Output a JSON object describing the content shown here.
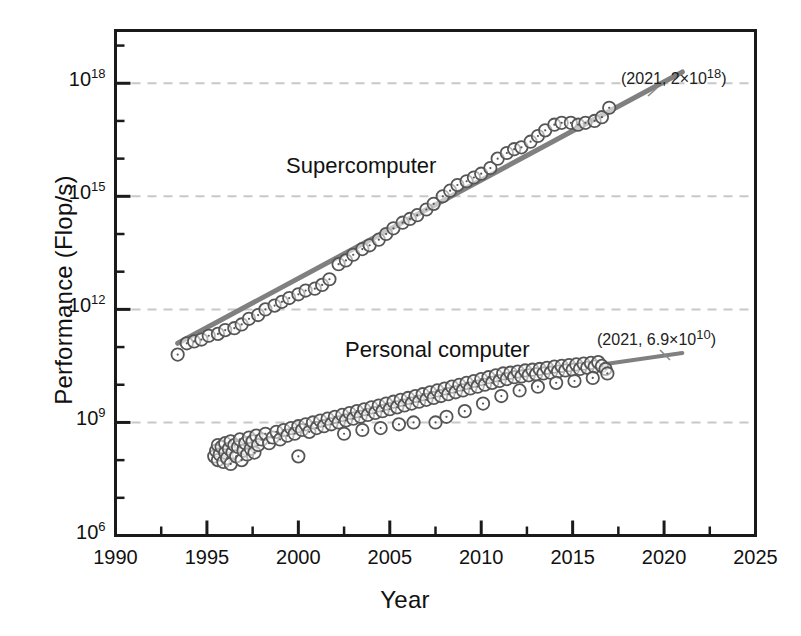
{
  "chart_data": {
    "type": "scatter",
    "title": "",
    "xlabel": "Year",
    "ylabel": "Performance (Flop/s)",
    "xlim": [
      1990,
      2025
    ],
    "ylim_exp": [
      6,
      19.4
    ],
    "y_scale": "log",
    "grid": "horizontal dashed light-gray at labeled decades",
    "legend": "inline series labels",
    "x_ticks": [
      "1990",
      "1995",
      "2000",
      "2005",
      "2010",
      "2015",
      "2020",
      "2025"
    ],
    "x_tick_values": [
      1990,
      1995,
      2000,
      2005,
      2010,
      2015,
      2020,
      2025
    ],
    "x_minor_step": 2.5,
    "y_ticks": [
      "10",
      "10",
      "10",
      "10",
      "10"
    ],
    "y_tick_exponents": [
      "6",
      "9",
      "12",
      "15",
      "18"
    ],
    "y_tick_values_exp": [
      6,
      9,
      12,
      15,
      18
    ],
    "y_minor_exponents": [
      7,
      8,
      10,
      11,
      13,
      14,
      16,
      17,
      19
    ],
    "series": [
      {
        "name": "Supercomputer",
        "label": "Supercomputer",
        "marker": "open-circle-with-center-dot",
        "color": "#4d4d4d",
        "trend_color": "#808080",
        "trend_start": [
          1993.4,
          11.1
        ],
        "trend_end": [
          2021.0,
          18.3
        ],
        "annotation": "(2021, 2×10",
        "annotation_exp": "18",
        "annotation_close": ")",
        "points": [
          [
            1993.4,
            10.8
          ],
          [
            1993.9,
            11.1
          ],
          [
            1994.3,
            11.15
          ],
          [
            1994.7,
            11.2
          ],
          [
            1995.1,
            11.3
          ],
          [
            1995.6,
            11.35
          ],
          [
            1996.0,
            11.45
          ],
          [
            1996.5,
            11.5
          ],
          [
            1996.9,
            11.6
          ],
          [
            1997.3,
            11.75
          ],
          [
            1997.8,
            11.85
          ],
          [
            1998.2,
            12.0
          ],
          [
            1998.7,
            12.1
          ],
          [
            1999.1,
            12.2
          ],
          [
            1999.5,
            12.3
          ],
          [
            2000.0,
            12.4
          ],
          [
            2000.4,
            12.5
          ],
          [
            2000.9,
            12.55
          ],
          [
            2001.3,
            12.65
          ],
          [
            2001.7,
            12.8
          ],
          [
            2002.2,
            13.2
          ],
          [
            2002.6,
            13.3
          ],
          [
            2003.0,
            13.45
          ],
          [
            2003.5,
            13.6
          ],
          [
            2003.9,
            13.7
          ],
          [
            2004.4,
            13.85
          ],
          [
            2004.8,
            14.0
          ],
          [
            2005.2,
            14.15
          ],
          [
            2005.7,
            14.3
          ],
          [
            2006.1,
            14.4
          ],
          [
            2006.5,
            14.5
          ],
          [
            2007.0,
            14.65
          ],
          [
            2007.4,
            14.8
          ],
          [
            2007.9,
            15.0
          ],
          [
            2008.3,
            15.15
          ],
          [
            2008.7,
            15.3
          ],
          [
            2009.2,
            15.4
          ],
          [
            2009.6,
            15.5
          ],
          [
            2010.0,
            15.6
          ],
          [
            2010.5,
            15.75
          ],
          [
            2010.9,
            16.0
          ],
          [
            2011.4,
            16.15
          ],
          [
            2011.8,
            16.25
          ],
          [
            2012.2,
            16.3
          ],
          [
            2012.7,
            16.45
          ],
          [
            2013.1,
            16.6
          ],
          [
            2013.5,
            16.75
          ],
          [
            2014.0,
            16.9
          ],
          [
            2014.4,
            16.95
          ],
          [
            2014.9,
            16.95
          ],
          [
            2015.3,
            16.9
          ],
          [
            2015.7,
            16.95
          ],
          [
            2016.2,
            17.0
          ],
          [
            2016.6,
            17.1
          ],
          [
            2017.0,
            17.35
          ]
        ]
      },
      {
        "name": "Personal computer",
        "label": "Personal computer",
        "marker": "open-circle-with-center-dot",
        "color": "#4d4d4d",
        "trend_color": "#808080",
        "trend_start": [
          2016.8,
          10.55
        ],
        "trend_end": [
          2021.0,
          10.84
        ],
        "annotation": "(2021, 6.9×10",
        "annotation_exp": "10",
        "annotation_close": ")",
        "points": [
          [
            1995.4,
            8.1
          ],
          [
            1995.5,
            8.25
          ],
          [
            1995.6,
            8.0
          ],
          [
            1995.6,
            8.4
          ],
          [
            1995.7,
            8.15
          ],
          [
            1995.8,
            8.35
          ],
          [
            1995.9,
            7.95
          ],
          [
            1996.0,
            8.2
          ],
          [
            1996.0,
            8.45
          ],
          [
            1996.1,
            8.05
          ],
          [
            1996.2,
            8.3
          ],
          [
            1996.3,
            8.5
          ],
          [
            1996.3,
            7.9
          ],
          [
            1996.4,
            8.2
          ],
          [
            1996.5,
            8.4
          ],
          [
            1996.6,
            8.1
          ],
          [
            1996.7,
            8.35
          ],
          [
            1996.8,
            8.55
          ],
          [
            1996.9,
            8.0
          ],
          [
            1997.0,
            8.25
          ],
          [
            1997.1,
            8.45
          ],
          [
            1997.2,
            8.15
          ],
          [
            1997.3,
            8.6
          ],
          [
            1997.4,
            8.3
          ],
          [
            1997.5,
            8.5
          ],
          [
            1997.6,
            8.2
          ],
          [
            1997.7,
            8.65
          ],
          [
            1997.8,
            8.4
          ],
          [
            1998.0,
            8.55
          ],
          [
            1998.2,
            8.7
          ],
          [
            1998.4,
            8.45
          ],
          [
            1998.6,
            8.6
          ],
          [
            1998.8,
            8.75
          ],
          [
            1999.0,
            8.55
          ],
          [
            1999.2,
            8.8
          ],
          [
            1999.4,
            8.65
          ],
          [
            1999.6,
            8.85
          ],
          [
            1999.8,
            8.7
          ],
          [
            2000.0,
            8.9
          ],
          [
            2000.0,
            8.1
          ],
          [
            2000.2,
            8.8
          ],
          [
            2000.4,
            8.95
          ],
          [
            2000.6,
            8.75
          ],
          [
            2000.8,
            9.0
          ],
          [
            2001.0,
            8.85
          ],
          [
            2001.2,
            9.05
          ],
          [
            2001.4,
            8.9
          ],
          [
            2001.6,
            9.1
          ],
          [
            2001.8,
            8.95
          ],
          [
            2002.0,
            9.15
          ],
          [
            2002.2,
            9.0
          ],
          [
            2002.4,
            9.2
          ],
          [
            2002.6,
            9.05
          ],
          [
            2002.8,
            9.25
          ],
          [
            2003.0,
            9.1
          ],
          [
            2003.2,
            9.3
          ],
          [
            2003.4,
            9.15
          ],
          [
            2003.6,
            9.35
          ],
          [
            2003.8,
            9.2
          ],
          [
            2004.0,
            9.4
          ],
          [
            2004.2,
            9.25
          ],
          [
            2004.4,
            9.45
          ],
          [
            2004.6,
            9.3
          ],
          [
            2004.8,
            9.5
          ],
          [
            2005.0,
            9.35
          ],
          [
            2005.2,
            9.55
          ],
          [
            2005.4,
            9.4
          ],
          [
            2005.6,
            9.6
          ],
          [
            2005.8,
            9.45
          ],
          [
            2006.0,
            9.65
          ],
          [
            2006.2,
            9.5
          ],
          [
            2006.4,
            9.7
          ],
          [
            2006.6,
            9.55
          ],
          [
            2006.8,
            9.75
          ],
          [
            2007.0,
            9.6
          ],
          [
            2007.2,
            9.8
          ],
          [
            2007.4,
            9.65
          ],
          [
            2007.6,
            9.85
          ],
          [
            2007.8,
            9.7
          ],
          [
            2008.0,
            9.9
          ],
          [
            2008.2,
            9.75
          ],
          [
            2008.4,
            9.95
          ],
          [
            2008.6,
            9.8
          ],
          [
            2008.8,
            10.0
          ],
          [
            2009.0,
            9.85
          ],
          [
            2009.2,
            10.05
          ],
          [
            2009.4,
            9.9
          ],
          [
            2009.6,
            10.1
          ],
          [
            2009.8,
            9.95
          ],
          [
            2010.0,
            10.15
          ],
          [
            2010.2,
            10.0
          ],
          [
            2010.4,
            10.2
          ],
          [
            2010.6,
            10.05
          ],
          [
            2010.8,
            10.25
          ],
          [
            2011.0,
            10.1
          ],
          [
            2011.2,
            10.3
          ],
          [
            2011.4,
            10.15
          ],
          [
            2011.6,
            10.32
          ],
          [
            2011.8,
            10.2
          ],
          [
            2012.0,
            10.35
          ],
          [
            2012.2,
            10.22
          ],
          [
            2012.4,
            10.38
          ],
          [
            2012.6,
            10.25
          ],
          [
            2012.8,
            10.4
          ],
          [
            2013.0,
            10.28
          ],
          [
            2013.2,
            10.42
          ],
          [
            2013.4,
            10.3
          ],
          [
            2013.6,
            10.45
          ],
          [
            2013.8,
            10.32
          ],
          [
            2014.0,
            10.48
          ],
          [
            2014.2,
            10.35
          ],
          [
            2014.4,
            10.5
          ],
          [
            2014.6,
            10.38
          ],
          [
            2014.8,
            10.52
          ],
          [
            2015.0,
            10.4
          ],
          [
            2015.2,
            10.54
          ],
          [
            2015.4,
            10.42
          ],
          [
            2015.6,
            10.56
          ],
          [
            2015.8,
            10.45
          ],
          [
            2016.0,
            10.58
          ],
          [
            2016.2,
            10.48
          ],
          [
            2016.4,
            10.6
          ],
          [
            2016.6,
            10.5
          ],
          [
            2016.8,
            10.42
          ],
          [
            2016.9,
            10.3
          ],
          [
            2007.5,
            9.0
          ],
          [
            2008.1,
            9.15
          ],
          [
            2006.3,
            9.0
          ],
          [
            2009.1,
            9.3
          ],
          [
            2010.1,
            9.5
          ],
          [
            2011.1,
            9.7
          ],
          [
            2012.1,
            9.85
          ],
          [
            2013.1,
            9.95
          ],
          [
            2014.1,
            10.05
          ],
          [
            2015.1,
            10.1
          ],
          [
            2016.1,
            10.18
          ],
          [
            2005.5,
            8.95
          ],
          [
            2004.5,
            8.85
          ],
          [
            2003.5,
            8.8
          ],
          [
            2002.5,
            8.7
          ]
        ]
      }
    ]
  },
  "axes": {
    "x_title": "Year",
    "y_title": "Performance (Flop/s)"
  },
  "colors": {
    "frame": "#1a1a1a",
    "grid": "#c8c8c8",
    "marker_stroke": "#555555",
    "trend": "#7a7a7a",
    "text": "#111111",
    "background": "#ffffff"
  }
}
